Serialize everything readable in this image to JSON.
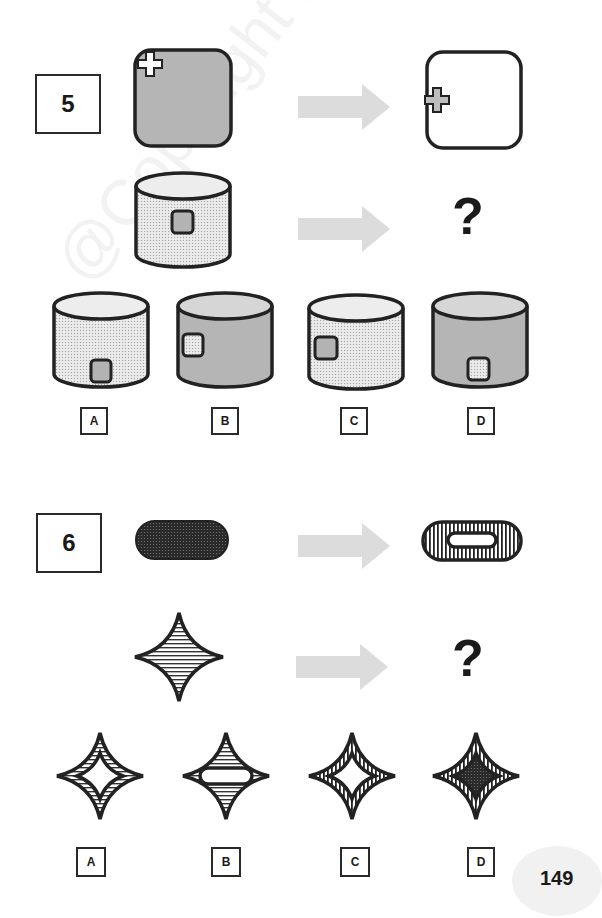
{
  "page_number": "149",
  "watermark": "@Copyright MindMill",
  "questions": [
    {
      "number": "5",
      "example_pair": {
        "from": "gray rounded square with white cross at top-left corner",
        "to": "white rounded square with gray cross at left edge"
      },
      "prompt_shape": "dotted cylinder with gray square window",
      "question_mark": "?",
      "options": [
        {
          "label": "A",
          "shape": "dotted cylinder, gray window bottom-right"
        },
        {
          "label": "B",
          "shape": "gray cylinder, dotted window left"
        },
        {
          "label": "C",
          "shape": "dotted cylinder, gray window left"
        },
        {
          "label": "D",
          "shape": "gray cylinder, dotted window bottom-center"
        }
      ]
    },
    {
      "number": "6",
      "example_pair": {
        "from": "dark dotted pill",
        "to": "vertically striped pill with white pill hole"
      },
      "prompt_shape": "horizontally striped four-point star",
      "question_mark": "?",
      "options": [
        {
          "label": "A",
          "shape": "horizontally striped star with white star hole"
        },
        {
          "label": "B",
          "shape": "horizontally striped star with white pill"
        },
        {
          "label": "C",
          "shape": "vertically striped star with white star hole"
        },
        {
          "label": "D",
          "shape": "vertically striped star with dark dotted inner star"
        }
      ]
    }
  ],
  "colors": {
    "outline": "#2a2a2a",
    "gray_fill": "#b3b3b3",
    "dotted_fill": "#e4e4e4",
    "arrow": "#dedede",
    "dark_fill": "#2e2e2e"
  }
}
